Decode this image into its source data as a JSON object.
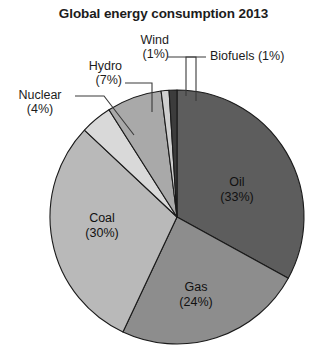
{
  "chart_data": {
    "type": "pie",
    "title": "Global energy consumption 2013",
    "xlabel": "",
    "ylabel": "",
    "legend_position": "none",
    "grid": false,
    "units": "percent",
    "categories": [
      "Oil",
      "Gas",
      "Coal",
      "Nuclear",
      "Hydro",
      "Wind",
      "Biofuels"
    ],
    "values": [
      33,
      24,
      30,
      4,
      7,
      1,
      1
    ],
    "start_angle_deg": 0,
    "direction": "clockwise",
    "slices": [
      {
        "name": "Oil",
        "label": "Oil",
        "percent": 33,
        "percent_label": "(33%)",
        "color": "#5d5d5d",
        "label_placement": "inside",
        "label_x": 237,
        "label_y": 186
      },
      {
        "name": "Gas",
        "label": "Gas",
        "percent": 24,
        "percent_label": "(24%)",
        "color": "#8d8d8d",
        "label_placement": "inside",
        "label_x": 196,
        "label_y": 291
      },
      {
        "name": "Coal",
        "label": "Coal",
        "percent": 30,
        "percent_label": "(30%)",
        "color": "#b9b9b9",
        "label_placement": "inside",
        "label_x": 102,
        "label_y": 222
      },
      {
        "name": "Nuclear",
        "label": "Nuclear",
        "percent": 4,
        "percent_label": "(4%)",
        "color": "#d9d9d9",
        "label_placement": "outside"
      },
      {
        "name": "Hydro",
        "label": "Hydro",
        "percent": 7,
        "percent_label": "(7%)",
        "color": "#a9a9a9",
        "label_placement": "outside"
      },
      {
        "name": "Wind",
        "label": "Wind",
        "percent": 1,
        "percent_label": "(1%)",
        "color": "#cfcfcf",
        "label_placement": "outside"
      },
      {
        "name": "Biofuels",
        "label": "Biofuels",
        "percent": 1,
        "percent_label": "(1%)",
        "color": "#3c3c3c",
        "label_placement": "outside"
      }
    ],
    "callouts": [
      {
        "name": "wind",
        "line1": "Wind",
        "line2": "(1%)"
      },
      {
        "name": "biofuels",
        "line1": "Biofuels (1%)",
        "line2": ""
      },
      {
        "name": "hydro",
        "line1": "Hydro",
        "line2": "(7%)"
      },
      {
        "name": "nuclear",
        "line1": "Nuclear",
        "line2": "(4%)"
      }
    ],
    "colors": {
      "background": "#ffffff",
      "outline": "#1a1a1a",
      "text": "#1c1c1c",
      "leader_line": "#3a3a3a"
    },
    "geometry": {
      "center_x": 177,
      "center_y": 217,
      "radius": 127
    }
  }
}
